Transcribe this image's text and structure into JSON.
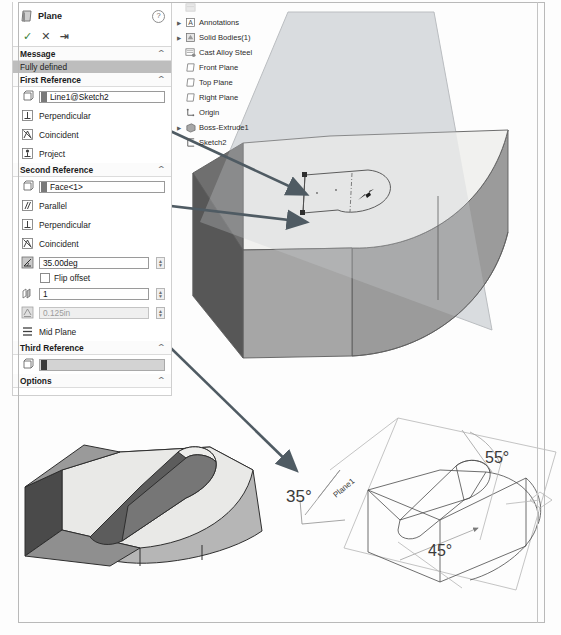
{
  "panel": {
    "title": "Plane",
    "help_icon": "?",
    "actions": [
      {
        "name": "accept",
        "glyph": "✓"
      },
      {
        "name": "cancel",
        "glyph": "✕"
      },
      {
        "name": "pin",
        "glyph": "⇥"
      }
    ],
    "sections": {
      "message": {
        "header": "Message",
        "status": "Fully defined"
      },
      "first_reference": {
        "header": "First Reference",
        "selection": "Line1@Sketch2",
        "constraints": [
          {
            "label": "Perpendicular",
            "icon": "perpendicular-icon"
          },
          {
            "label": "Coincident",
            "icon": "coincident-icon"
          },
          {
            "label": "Project",
            "icon": "project-icon"
          }
        ]
      },
      "second_reference": {
        "header": "Second Reference",
        "selection": "Face<1>",
        "constraints": [
          {
            "label": "Parallel",
            "icon": "parallel-icon"
          },
          {
            "label": "Perpendicular",
            "icon": "perpendicular-icon"
          },
          {
            "label": "Coincident",
            "icon": "coincident-icon"
          }
        ],
        "angle_value": "35.00deg",
        "flip_offset_label": "Flip offset",
        "count_value": "1",
        "offset_distance": "0.125in",
        "mid_plane_label": "Mid Plane"
      },
      "third_reference": {
        "header": "Third Reference",
        "selection": ""
      },
      "options": {
        "header": "Options"
      }
    },
    "collapse_glyph": "⌃"
  },
  "tree": {
    "items": [
      {
        "label": "",
        "icon": "cut-list-icon",
        "expandable": false,
        "faded": true
      },
      {
        "label": "Annotations",
        "icon": "annotations-icon",
        "expandable": true,
        "faded": false
      },
      {
        "label": "Solid Bodies(1)",
        "icon": "solid-bodies-icon",
        "expandable": true,
        "faded": false
      },
      {
        "label": "Cast Alloy Steel",
        "icon": "material-icon",
        "expandable": false,
        "faded": false
      },
      {
        "label": "Front Plane",
        "icon": "plane-icon",
        "expandable": false,
        "faded": false
      },
      {
        "label": "Top Plane",
        "icon": "plane-icon",
        "expandable": false,
        "faded": false
      },
      {
        "label": "Right Plane",
        "icon": "plane-icon",
        "expandable": false,
        "faded": false
      },
      {
        "label": "Origin",
        "icon": "origin-icon",
        "expandable": false,
        "faded": false
      },
      {
        "label": "Boss-Extrude1",
        "icon": "extrude-icon",
        "expandable": true,
        "faded": false
      },
      {
        "label": "Sketch2",
        "icon": "sketch-icon",
        "expandable": false,
        "faded": false
      }
    ]
  },
  "annotations": {
    "angle_35": "35°",
    "angle_55": "55°",
    "angle_45": "45°",
    "plane_label": "Plane1"
  },
  "colors": {
    "panel_bg": "#ffffff",
    "status_bar": "#bdbdbd",
    "arrow": "#4f5b63",
    "plane_fill": "#d7dadd",
    "model_top": "#f2f2f0",
    "model_front": "#a8a8a8",
    "model_left_dark": "#565656",
    "model_side": "#8e8e8e",
    "sketch_line": "#5a5a5a",
    "ink": "#4a4a4a"
  }
}
